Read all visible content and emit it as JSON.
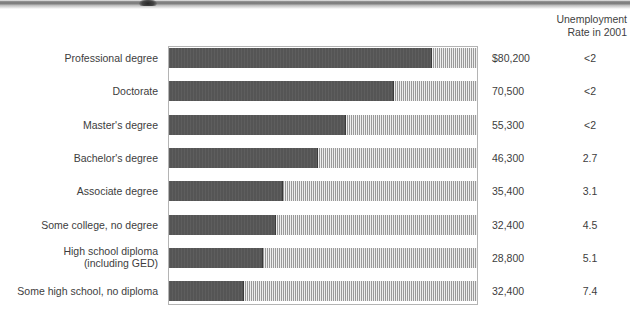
{
  "header": {
    "line1": "Unemployment",
    "line2": "Rate in 2001"
  },
  "chart_data": {
    "type": "bar",
    "title": "",
    "xlabel": "",
    "ylabel": "",
    "grid": false,
    "legend": "none",
    "orientation": "horizontal",
    "axis_note": "Bars drawn inside a common-width box; dark segment length is proportional to median annual earnings, hatched remainder fills the box to a common right edge.",
    "xlim": [
      0,
      96000
    ],
    "columns": [
      "Education level",
      "Median annual earnings",
      "Unemployment Rate in 2001"
    ],
    "categories": [
      "Professional degree",
      "Doctorate",
      "Master's degree",
      "Bachelor's degree",
      "Associate degree",
      "Some college, no degree",
      "High school diploma (including GED)",
      "Some high school, no diploma"
    ],
    "values": [
      80200,
      70500,
      55300,
      46300,
      35400,
      32400,
      28800,
      32400
    ],
    "series": [
      {
        "name": "Median annual earnings",
        "values": [
          80200,
          70500,
          55300,
          46300,
          35400,
          32400,
          28800,
          32400
        ]
      },
      {
        "name": "Unemployment rate in 2001 (percent)",
        "values": [
          "<2",
          "<2",
          "<2",
          2.7,
          3.1,
          4.5,
          5.1,
          7.4
        ]
      }
    ]
  },
  "rows": [
    {
      "label": "Professional degree",
      "label_line1": "Professional degree",
      "label_line2": "",
      "earnings": "$80,200",
      "rate": "<2",
      "fill_px": 263
    },
    {
      "label": "Doctorate",
      "label_line1": "Doctorate",
      "label_line2": "",
      "earnings": "70,500",
      "rate": "<2",
      "fill_px": 225
    },
    {
      "label": "Master's degree",
      "label_line1": "Master's degree",
      "label_line2": "",
      "earnings": "55,300",
      "rate": "<2",
      "fill_px": 177
    },
    {
      "label": "Bachelor's degree",
      "label_line1": "Bachelor's degree",
      "label_line2": "",
      "earnings": "46,300",
      "rate": "2.7",
      "fill_px": 149
    },
    {
      "label": "Associate degree",
      "label_line1": "Associate degree",
      "label_line2": "",
      "earnings": "35,400",
      "rate": "3.1",
      "fill_px": 114
    },
    {
      "label": "Some college, no degree",
      "label_line1": "Some college, no degree",
      "label_line2": "",
      "earnings": "32,400",
      "rate": "4.5",
      "fill_px": 107
    },
    {
      "label": "High school diploma (including GED)",
      "label_line1": "High school diploma",
      "label_line2": "(including GED)",
      "earnings": "28,800",
      "rate": "5.1",
      "fill_px": 94
    },
    {
      "label": "Some high school, no diploma",
      "label_line1": "Some high school, no diploma",
      "label_line2": "",
      "earnings": "32,400",
      "rate": "7.4",
      "fill_px": 75
    }
  ],
  "colors": {
    "bar_fill": "#585858",
    "bar_hatch": "#9a9a9a",
    "box_border": "#b4b4b4",
    "text": "#3d3d3d"
  }
}
